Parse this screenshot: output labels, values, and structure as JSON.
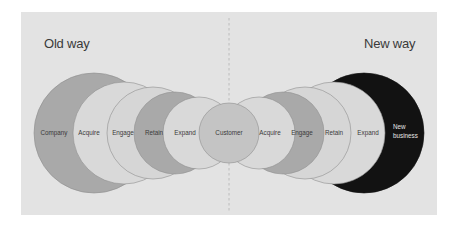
{
  "headings": {
    "left": "Old way",
    "right": "New way"
  },
  "colors": {
    "panel": "#e3e3e3",
    "dark_gray": "#a9a9a9",
    "light_gray": "#d9d9d9",
    "mid_gray": "#c4c4c4",
    "black": "#121212",
    "outline": "#8e8e8e",
    "divider": "#b5b5b5"
  },
  "old_way": {
    "circles": [
      {
        "label": "Company",
        "tone": "dark"
      },
      {
        "label": "Acquire",
        "tone": "light"
      },
      {
        "label": "Engage",
        "tone": "light"
      },
      {
        "label": "Retain",
        "tone": "dark"
      },
      {
        "label": "Expand",
        "tone": "light"
      }
    ]
  },
  "center": {
    "label": "Customer",
    "tone": "mid"
  },
  "new_way": {
    "circles": [
      {
        "label": "Acquire",
        "tone": "light"
      },
      {
        "label": "Engage",
        "tone": "dark"
      },
      {
        "label": "Retain",
        "tone": "light"
      },
      {
        "label": "Expand",
        "tone": "light"
      },
      {
        "label_line1": "New",
        "label_line2": "business",
        "tone": "black"
      }
    ]
  }
}
